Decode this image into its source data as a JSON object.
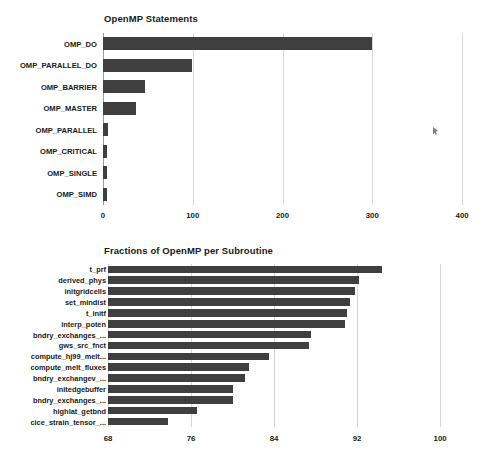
{
  "page": {
    "background": "#ffffff",
    "bar_color": "#3f3f3f",
    "grid_color": "#d8d8d8",
    "axis_color": "#9a9a9a",
    "text_color": "#1a1a1a"
  },
  "cursor": {
    "name": "mouse-pointer",
    "x": 433,
    "y": 127
  },
  "chart_data": [
    {
      "id": "openmp-statements",
      "type": "bar",
      "orientation": "horizontal",
      "title": "OpenMP Statements",
      "xlabel": "",
      "ylabel": "",
      "xlim": [
        0,
        420
      ],
      "xticks": [
        0,
        100,
        200,
        300,
        400
      ],
      "xtick_labels": [
        "0",
        "100",
        "200",
        "300",
        "400"
      ],
      "grid": true,
      "legend": false,
      "categories": [
        "OMP_DO",
        "OMP_PARALLEL_DO",
        "OMP_BARRIER",
        "OMP_MASTER",
        "OMP_PARALLEL",
        "OMP_CRITICAL",
        "OMP_SINGLE",
        "OMP_SIMD"
      ],
      "values": [
        300,
        99,
        47,
        37,
        6,
        5,
        5,
        4
      ]
    },
    {
      "id": "fractions-openmp-per-subroutine",
      "type": "bar",
      "orientation": "horizontal",
      "title": "Fractions of OpenMP per Subroutine",
      "xlabel": "",
      "ylabel": "",
      "xlim": [
        68,
        102.5
      ],
      "xticks": [
        68,
        76,
        84,
        92,
        100
      ],
      "xtick_labels": [
        "68",
        "76",
        "84",
        "92",
        "100"
      ],
      "grid": true,
      "legend": false,
      "categories": [
        "t_prf",
        "derived_phys",
        "initgridcells",
        "set_mindist",
        "t_initf",
        "interp_poten",
        "bndry_exchanges_...",
        "gws_src_fnct",
        "compute_hj99_melt...",
        "compute_melt_fluxes",
        "bndry_exchangev_...",
        "initedgebuffer",
        "bndry_exchanges_...",
        "highlat_getbnd",
        "cice_strain_tensor_..."
      ],
      "values": [
        94.4,
        92.2,
        91.8,
        91.3,
        91.0,
        90.8,
        87.6,
        87.4,
        83.5,
        81.6,
        81.2,
        80.0,
        80.0,
        76.6,
        73.8
      ]
    }
  ]
}
